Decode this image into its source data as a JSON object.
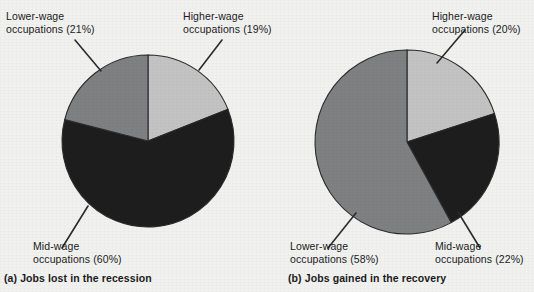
{
  "figure": {
    "background_color": "#f1f1f0"
  },
  "palette": {
    "higher_wage": "#c3c3c3",
    "mid_wage": "#1d1d1d",
    "lower_wage": "#7f8082",
    "outline": "#2b2b2b",
    "leader_line": "#2b2b2b",
    "text": "#1b1b1b"
  },
  "panels": [
    {
      "id": "a",
      "caption": "(a) Jobs lost in the recession",
      "callouts": {
        "lower": "Lower-wage\noccupations (21%)",
        "higher": "Higher-wage\noccupations (19%)",
        "mid": "Mid-wage\noccupations (60%)"
      }
    },
    {
      "id": "b",
      "caption": "(b) Jobs gained in the recovery",
      "callouts": {
        "higher": "Higher-wage\noccupations (20%)",
        "lower": "Lower-wage\noccupations (58%)",
        "mid": "Mid-wage\noccupations (22%)"
      }
    }
  ],
  "chart_data": [
    {
      "type": "pie",
      "title": "(a) Jobs lost in the recession",
      "categories": [
        "Higher-wage occupations",
        "Mid-wage occupations",
        "Lower-wage occupations"
      ],
      "values": [
        19,
        60,
        21
      ],
      "unit": "%",
      "colors": [
        "#c3c3c3",
        "#1d1d1d",
        "#7f8082"
      ],
      "start_angle_deg": 0,
      "direction": "clockwise",
      "labels": [
        "Higher-wage occupations (19%)",
        "Mid-wage occupations (60%)",
        "Lower-wage occupations (21%)"
      ],
      "legend": "none",
      "grid": false
    },
    {
      "type": "pie",
      "title": "(b) Jobs gained in the recovery",
      "categories": [
        "Higher-wage occupations",
        "Mid-wage occupations",
        "Lower-wage occupations"
      ],
      "values": [
        20,
        22,
        58
      ],
      "unit": "%",
      "colors": [
        "#c3c3c3",
        "#1d1d1d",
        "#7f8082"
      ],
      "start_angle_deg": 0,
      "direction": "clockwise",
      "labels": [
        "Higher-wage occupations (20%)",
        "Mid-wage occupations (22%)",
        "Lower-wage occupations (58%)"
      ],
      "legend": "none",
      "grid": false
    }
  ]
}
